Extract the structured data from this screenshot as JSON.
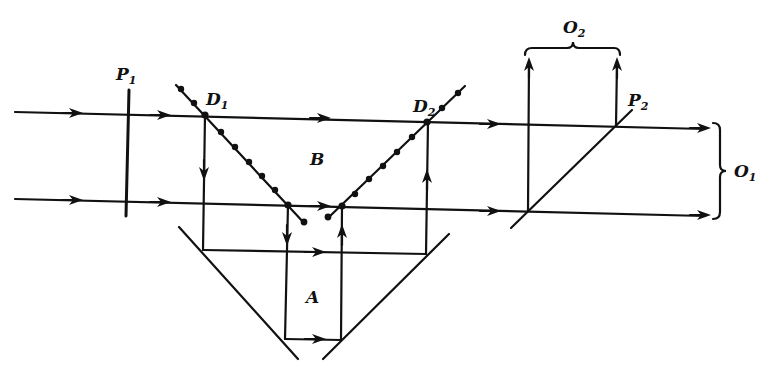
{
  "diagram": {
    "type": "optical interferometer schematic",
    "labels": {
      "P1": {
        "main": "P",
        "sub": "1"
      },
      "P2": {
        "main": "P",
        "sub": "2"
      },
      "D1": {
        "main": "D",
        "sub": "1"
      },
      "D2": {
        "main": "D",
        "sub": "2"
      },
      "O1": {
        "main": "O",
        "sub": "1"
      },
      "O2": {
        "main": "O",
        "sub": "2"
      },
      "B": "B",
      "A": "A"
    },
    "elements": [
      {
        "id": "P1",
        "kind": "vertical plate"
      },
      {
        "id": "D1",
        "kind": "dotted beam splitter (diagonal, descending)"
      },
      {
        "id": "D2",
        "kind": "dotted beam splitter (diagonal, ascending)"
      },
      {
        "id": "mirror-left",
        "kind": "lower-left mirror"
      },
      {
        "id": "mirror-right",
        "kind": "lower-right mirror"
      },
      {
        "id": "P2",
        "kind": "diagonal plate / beam splitter"
      },
      {
        "id": "O1",
        "kind": "output brace (right)"
      },
      {
        "id": "O2",
        "kind": "output brace (top)"
      }
    ],
    "regions": [
      "B",
      "A"
    ],
    "colors": {
      "ink": "#111111",
      "background": "#ffffff"
    }
  }
}
